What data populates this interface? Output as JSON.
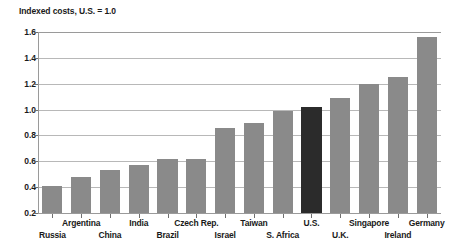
{
  "chart_data": {
    "type": "bar",
    "title": "Indexed costs, U.S. = 1.0",
    "xlabel": "",
    "ylabel": "",
    "ylim": [
      0.2,
      1.6
    ],
    "ytick_labels": [
      "1.6",
      "1.4",
      "1.2",
      "1.0",
      "0.8",
      "0.6",
      "0.4",
      "0.2"
    ],
    "ytick_values": [
      1.6,
      1.4,
      1.2,
      1.0,
      0.8,
      0.6,
      0.4,
      0.2
    ],
    "grid": true,
    "legend": "none",
    "categories": [
      "Russia",
      "Argentina",
      "China",
      "India",
      "Brazil",
      "Czech Rep.",
      "Israel",
      "Taiwan",
      "S. Africa",
      "U.S.",
      "U.K.",
      "Singapore",
      "Ireland",
      "Germany"
    ],
    "values": [
      0.41,
      0.48,
      0.53,
      0.57,
      0.62,
      0.62,
      0.86,
      0.9,
      0.99,
      1.02,
      1.09,
      1.2,
      1.25,
      1.56
    ],
    "highlight_category": "U.S.",
    "colors": {
      "bar": "#8a8a8a",
      "highlight_bar": "#2b2b2b",
      "grid": "#b8b8b8",
      "axis": "#9a9a9a",
      "text": "#1a1a1a",
      "background": "#ffffff"
    },
    "label_rows": [
      1,
      0,
      1,
      0,
      1,
      0,
      1,
      0,
      1,
      0,
      1,
      0,
      1,
      0
    ]
  }
}
